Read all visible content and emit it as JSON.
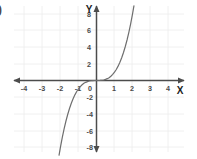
{
  "question": {
    "marker": ")"
  },
  "axes": {
    "x_label": "X",
    "y_label": "Y",
    "origin_label": "0"
  },
  "chart_data": {
    "type": "line",
    "title": "",
    "xlabel": "X",
    "ylabel": "Y",
    "grid": true,
    "legend": false,
    "xlim": [
      -5,
      5
    ],
    "ylim": [
      -9,
      9
    ],
    "x_ticks": [
      -4,
      -3,
      -2,
      -1,
      0,
      1,
      2,
      3,
      4
    ],
    "x_tick_labels": [
      "-4",
      "-3",
      "-2",
      "-1",
      "0",
      "1",
      "2",
      "3",
      "4"
    ],
    "y_ticks": [
      8,
      6,
      4,
      2,
      -2,
      -4,
      -6,
      -8
    ],
    "y_tick_labels": [
      "8",
      "6",
      "4",
      "2",
      "-2",
      "-4",
      "-6",
      "-8"
    ],
    "series": [
      {
        "name": "y = x^3",
        "equation": "y = x^3",
        "x": [
          -2.08,
          -2.0,
          -1.9,
          -1.8,
          -1.7,
          -1.6,
          -1.5,
          -1.4,
          -1.3,
          -1.2,
          -1.1,
          -1.0,
          -0.9,
          -0.8,
          -0.7,
          -0.6,
          -0.5,
          -0.4,
          -0.3,
          -0.2,
          -0.1,
          0.0,
          0.1,
          0.2,
          0.3,
          0.4,
          0.5,
          0.6,
          0.7,
          0.8,
          0.9,
          1.0,
          1.1,
          1.2,
          1.3,
          1.4,
          1.5,
          1.6,
          1.7,
          1.8,
          1.9,
          2.0,
          2.08
        ],
        "y": [
          -9.0,
          -8.0,
          -6.86,
          -5.83,
          -4.91,
          -4.1,
          -3.38,
          -2.74,
          -2.2,
          -1.73,
          -1.33,
          -1.0,
          -0.73,
          -0.51,
          -0.34,
          -0.22,
          -0.13,
          -0.06,
          -0.03,
          -0.01,
          0.0,
          0.0,
          0.0,
          0.01,
          0.03,
          0.06,
          0.13,
          0.22,
          0.34,
          0.51,
          0.73,
          1.0,
          1.33,
          1.73,
          2.2,
          2.74,
          3.38,
          4.1,
          4.91,
          5.83,
          6.86,
          8.0,
          9.0
        ]
      }
    ]
  },
  "colors": {
    "curve": "#6e6e6e",
    "axis": "#4c4c4c",
    "grid": "#ececec",
    "text": "#4a4a4a",
    "background": "#ffffff"
  }
}
